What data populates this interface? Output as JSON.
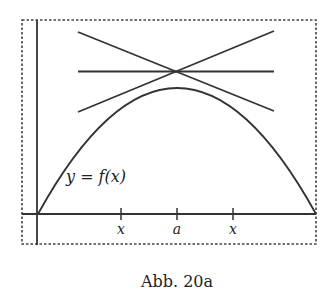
{
  "figure": {
    "caption": "Abb. 20a",
    "curve_label": "y = f(x)",
    "tick_labels": [
      "x",
      "a",
      "x"
    ],
    "colors": {
      "ink": "#333333",
      "background": "#ffffff"
    }
  },
  "diagram": {
    "elements": [
      "dashed-frame",
      "y-axis",
      "x-axis",
      "curve",
      "tangent-left",
      "tangent-right",
      "horizontal-line"
    ]
  }
}
